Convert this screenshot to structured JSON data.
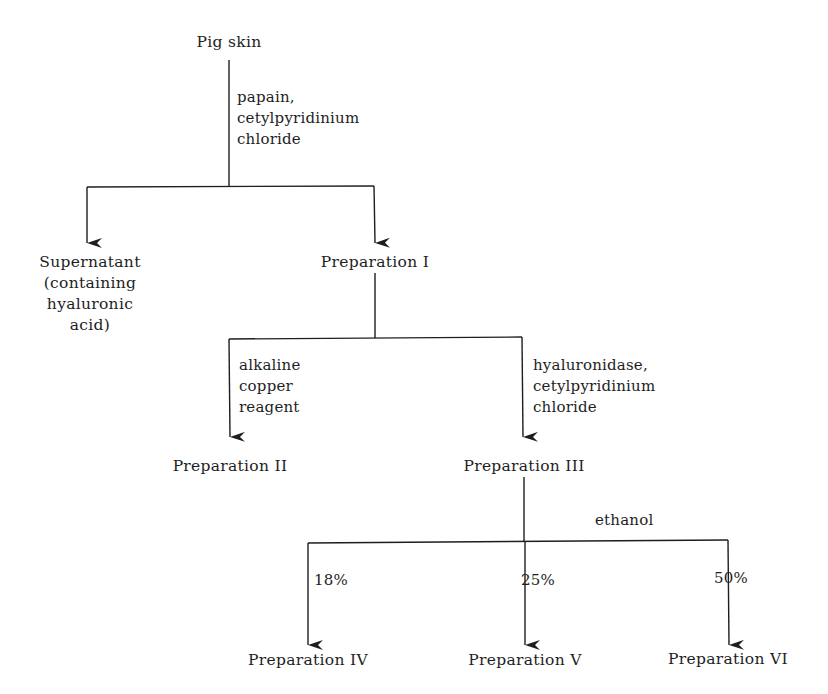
{
  "diagram": {
    "type": "flowchart",
    "nodes": {
      "pig_skin": "Pig skin",
      "supernatant": "Supernatant\n(containing\nhyaluronic\nacid)",
      "prep_1": "Preparation I",
      "prep_2": "Preparation II",
      "prep_3": "Preparation III",
      "prep_4": "Preparation IV",
      "prep_5": "Preparation V",
      "prep_6": "Preparation VI"
    },
    "edge_labels": {
      "papain": "papain,\ncetylpyridinium\nchloride",
      "alkaline": "alkaline\ncopper\nreagent",
      "hyaluronidase": "hyaluronidase,\ncetylpyridinium\nchloride",
      "ethanol": "ethanol",
      "pct_18": "18%",
      "pct_25": "25%",
      "pct_50": "50%"
    },
    "edges": [
      {
        "from": "Pig skin",
        "to": "Supernatant (containing hyaluronic acid)",
        "via": "papain, cetylpyridinium chloride"
      },
      {
        "from": "Pig skin",
        "to": "Preparation I",
        "via": "papain, cetylpyridinium chloride"
      },
      {
        "from": "Preparation I",
        "to": "Preparation II",
        "via": "alkaline copper reagent"
      },
      {
        "from": "Preparation I",
        "to": "Preparation III",
        "via": "hyaluronidase, cetylpyridinium chloride"
      },
      {
        "from": "Preparation III",
        "to": "Preparation IV",
        "via": "ethanol 18%"
      },
      {
        "from": "Preparation III",
        "to": "Preparation V",
        "via": "ethanol 25%"
      },
      {
        "from": "Preparation III",
        "to": "Preparation VI",
        "via": "ethanol 50%"
      }
    ],
    "colors": {
      "line": "#1e1e1e",
      "background": "#ffffff"
    }
  }
}
